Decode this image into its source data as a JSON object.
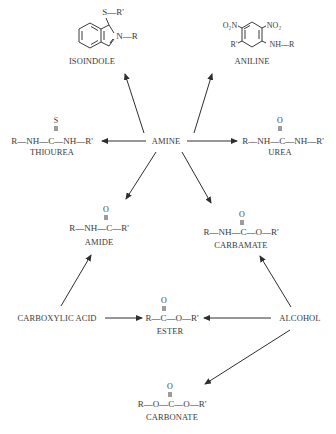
{
  "diagram": {
    "center": {
      "label": "AMINE"
    },
    "nodes": {
      "isoindole": {
        "label": "ISOINDOLE",
        "substituent_s": "S—R'",
        "substituent_n": "N—R"
      },
      "aniline": {
        "label": "ANILINE",
        "no2_left": "O₂N",
        "no2_right": "NO₂",
        "r_prime": "R'",
        "nh_r": "NH—R"
      },
      "thiourea": {
        "label": "THIOUREA",
        "formula": "R—NH—C—NH—R'",
        "double_bond_atom": "S"
      },
      "urea": {
        "label": "UREA",
        "formula": "R—NH—C—NH—R'",
        "double_bond_atom": "O"
      },
      "amide": {
        "label": "AMIDE",
        "formula": "R—NH—C—R'",
        "double_bond_atom": "O"
      },
      "carbamate": {
        "label": "CARBAMATE",
        "formula": "R—NH—C—O—R'",
        "double_bond_atom": "O"
      },
      "carboxylic_acid": {
        "label": "CARBOXYLIC ACID"
      },
      "ester": {
        "label": "ESTER",
        "formula": "R—C—O—R'",
        "double_bond_atom": "O"
      },
      "alcohol": {
        "label": "ALCOHOL"
      },
      "carbonate": {
        "label": "CARBONATE",
        "formula": "R—O—C—O—R'",
        "double_bond_atom": "O"
      }
    },
    "edges": [
      {
        "from": "AMINE",
        "to": "ISOINDOLE"
      },
      {
        "from": "AMINE",
        "to": "ANILINE"
      },
      {
        "from": "AMINE",
        "to": "THIOUREA"
      },
      {
        "from": "AMINE",
        "to": "UREA"
      },
      {
        "from": "AMINE",
        "to": "AMIDE"
      },
      {
        "from": "AMINE",
        "to": "CARBAMATE"
      },
      {
        "from": "CARBOXYLIC ACID",
        "to": "AMIDE"
      },
      {
        "from": "CARBOXYLIC ACID",
        "to": "ESTER"
      },
      {
        "from": "ALCOHOL",
        "to": "ESTER"
      },
      {
        "from": "ALCOHOL",
        "to": "CARBAMATE"
      },
      {
        "from": "ALCOHOL",
        "to": "CARBONATE"
      }
    ],
    "colors": {
      "ink": "#3a3a3a",
      "background": "#ffffff"
    }
  }
}
